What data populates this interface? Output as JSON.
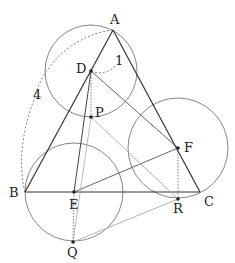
{
  "diagram": {
    "type": "geometry",
    "points": {
      "A": {
        "label": "A"
      },
      "B": {
        "label": "B"
      },
      "C": {
        "label": "C"
      },
      "D": {
        "label": "D"
      },
      "E": {
        "label": "E"
      },
      "F": {
        "label": "F"
      },
      "P": {
        "label": "P"
      },
      "Q": {
        "label": "Q"
      },
      "R": {
        "label": "R"
      }
    },
    "measures": {
      "AD": "1",
      "AB": "4"
    },
    "colors": {
      "stroke_dark": "#333333",
      "stroke_circle": "#777777",
      "stroke_light": "#aaaaaa",
      "stroke_dashed": "#666666"
    }
  }
}
